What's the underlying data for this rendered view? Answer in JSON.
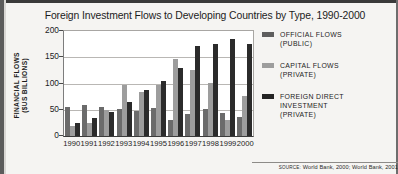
{
  "chart_data": {
    "type": "bar",
    "title": "Foreign Investment Flows to Developing Countries by Type, 1990-2000",
    "xlabel": "",
    "ylabel": "FINANCIAL FLOWS ($US BILLIONS)",
    "ylabel_line1": "FINANCIAL FLOWS",
    "ylabel_line2": "($US BILLIONS)",
    "ylim": [
      0,
      200
    ],
    "yticks": [
      200,
      150,
      100,
      50,
      0
    ],
    "grid": true,
    "legend_position": "right",
    "categories": [
      "1990",
      "1991",
      "1992",
      "1993",
      "1994",
      "1995",
      "1996",
      "1997",
      "1998",
      "1999",
      "2000"
    ],
    "series": [
      {
        "name": "OFFICIAL FLOWS (PUBLIC)",
        "name_line1": "OFFICIAL FLOWS",
        "name_line2": "(PUBLIC)",
        "color": "#6b6b6b",
        "values": [
          55,
          59,
          55,
          52,
          47,
          54,
          30,
          41,
          52,
          43,
          36
        ]
      },
      {
        "name": "CAPITAL FLOWS (PRIVATE)",
        "name_line1": "CAPITAL FLOWS",
        "name_line2": "(PRIVATE)",
        "color": "#9d9d9d",
        "values": [
          19,
          25,
          49,
          98,
          84,
          97,
          146,
          125,
          101,
          31,
          77
        ]
      },
      {
        "name": "FOREIGN DIRECT INVESTMENT (PRIVATE)",
        "name_line1": "FOREIGN DIRECT",
        "name_line2": "INVESTMENT",
        "name_line3": "(PRIVATE)",
        "color": "#2b2b2b",
        "values": [
          24,
          35,
          46,
          64,
          88,
          105,
          129,
          171,
          176,
          184,
          176
        ]
      }
    ]
  },
  "source": {
    "label": "SOURCE:",
    "text": "World Bank, 2000; World Bank, 2001"
  }
}
